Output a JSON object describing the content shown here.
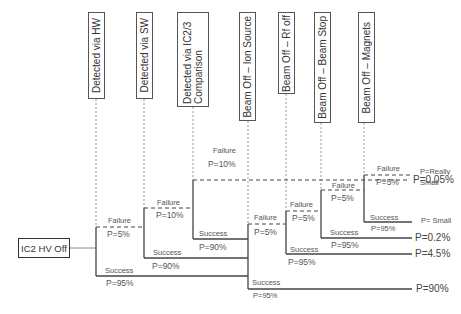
{
  "diagram": {
    "type": "event-tree",
    "initiating_event": "IC2 HV Off",
    "stages": [
      {
        "label": "Detected via HW"
      },
      {
        "label": "Detected via SW"
      },
      {
        "label": "Detected via IC2/3 Comparison"
      },
      {
        "label": "Beam Off – Ion Source"
      },
      {
        "label": "Beam Off – Rf off"
      },
      {
        "label": "Beam Off – Beam Stop"
      },
      {
        "label": "Beam Off – Magnets"
      }
    ],
    "branches": {
      "hw_failure": {
        "label": "Failure",
        "p": "P=5%"
      },
      "hw_success": {
        "label": "Success",
        "p": "P=95%"
      },
      "sw_failure": {
        "label": "Failure",
        "p": "P=10%"
      },
      "sw_success": {
        "label": "Success",
        "p": "P=90%"
      },
      "ic_failure": {
        "label": "Failure",
        "p": "P=10%"
      },
      "ic_success": {
        "label": "Success",
        "p": "P=90%"
      },
      "ion_failure": {
        "label": "Failure",
        "p": "P=5%"
      },
      "ion_success": {
        "label": "Success",
        "p": "P=95%"
      },
      "rf_failure": {
        "label": "Failure",
        "p": "P=5%"
      },
      "rf_success": {
        "label": "Success",
        "p": "P=95%"
      },
      "bs_failure": {
        "label": "Failure",
        "p": "P=5%"
      },
      "bs_success": {
        "label": "Success",
        "p": "P=95%"
      },
      "mag_failure": {
        "label": "Failure",
        "p": "P=5%"
      },
      "mag_success": {
        "label": "Success",
        "p": "P=95%"
      }
    },
    "outcomes": [
      {
        "p": "P=0.05%"
      },
      {
        "p": "P=Really Small"
      },
      {
        "p": "P= Small"
      },
      {
        "p": "P=0.2%"
      },
      {
        "p": "P=4.5%"
      },
      {
        "p": "P=90%"
      }
    ]
  }
}
